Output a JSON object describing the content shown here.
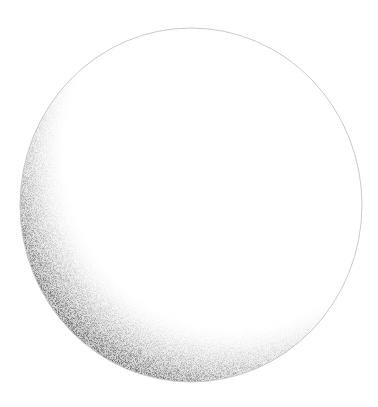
{
  "illustration": {
    "title": "Stippled sphere",
    "subject": "sphere",
    "style": "stipple shading",
    "light_direction": "upper-right",
    "shadow_side": "lower-left",
    "colors": {
      "background": "#ffffff",
      "outline": "#bdbdbd",
      "shadow": "#3a3a3a",
      "highlight": "#ffffff"
    },
    "geometry": {
      "cx": 191,
      "cy": 205,
      "rx": 171,
      "ry": 177
    }
  }
}
